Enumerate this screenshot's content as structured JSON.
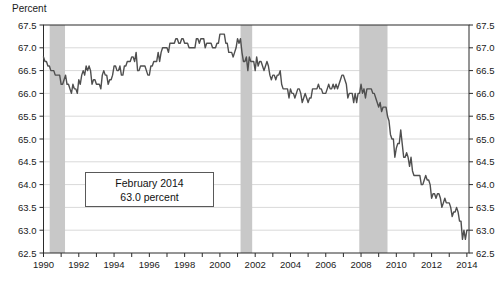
{
  "chart": {
    "y_axis_title": "Percent",
    "annotation": {
      "line1": "February 2014",
      "line2": "63.0 percent"
    },
    "colors": {
      "line": "#4f4f4f",
      "grid": "#d9d9d9",
      "band": "#c8c8c8",
      "axis": "#2b2b2b",
      "text": "#1a1a1a",
      "annotation_border": "#595959",
      "background": "#ffffff"
    }
  },
  "chart_data": {
    "type": "line",
    "title": "",
    "xlabel": "",
    "ylabel": "Percent",
    "xlim": [
      1990,
      2014.12
    ],
    "ylim": [
      62.5,
      67.5
    ],
    "grid": "horizontal",
    "legend": "none",
    "x_tick_labels": [
      "1990",
      "1992",
      "1994",
      "1996",
      "1998",
      "2000",
      "2002",
      "2004",
      "2006",
      "2008",
      "2010",
      "2012",
      "2014"
    ],
    "x_minor_tick_interval_years": 1,
    "y_tick_labels": [
      "62.5",
      "63.0",
      "63.5",
      "64.0",
      "64.5",
      "65.0",
      "65.5",
      "66.0",
      "66.5",
      "67.0",
      "67.5"
    ],
    "y_tick_step": 0.5,
    "recession_bands": [
      [
        1990.35,
        1991.22
      ],
      [
        2001.17,
        2001.83
      ],
      [
        2007.9,
        2009.5
      ]
    ],
    "annotation": {
      "line1": "February 2014",
      "line2": "63.0 percent"
    },
    "series": [
      {
        "name": "percent",
        "x_start": 1990.0,
        "x_step_years": 0.0833333,
        "values": [
          66.8,
          66.7,
          66.7,
          66.6,
          66.6,
          66.5,
          66.5,
          66.5,
          66.4,
          66.4,
          66.4,
          66.4,
          66.2,
          66.2,
          66.3,
          66.4,
          66.2,
          66.2,
          66.1,
          66.0,
          66.2,
          66.1,
          66.1,
          66.0,
          66.3,
          66.2,
          66.4,
          66.5,
          66.4,
          66.6,
          66.5,
          66.6,
          66.5,
          66.2,
          66.3,
          66.3,
          66.2,
          66.2,
          66.2,
          66.1,
          66.4,
          66.5,
          66.4,
          66.4,
          66.2,
          66.3,
          66.3,
          66.4,
          66.6,
          66.6,
          66.5,
          66.5,
          66.6,
          66.4,
          66.4,
          66.6,
          66.6,
          66.7,
          66.7,
          66.7,
          66.8,
          66.8,
          66.7,
          66.9,
          66.5,
          66.5,
          66.6,
          66.6,
          66.6,
          66.6,
          66.5,
          66.4,
          66.4,
          66.6,
          66.6,
          66.7,
          66.7,
          66.7,
          66.9,
          66.7,
          66.9,
          67.0,
          67.0,
          67.0,
          67.0,
          66.9,
          67.1,
          67.1,
          67.1,
          67.1,
          67.2,
          67.2,
          67.1,
          67.1,
          67.2,
          67.2,
          67.1,
          67.1,
          67.1,
          67.0,
          67.0,
          67.0,
          67.0,
          67.0,
          67.2,
          67.2,
          67.1,
          67.2,
          67.2,
          67.2,
          67.0,
          67.1,
          67.1,
          67.1,
          67.1,
          67.0,
          67.0,
          67.0,
          67.1,
          67.1,
          67.3,
          67.3,
          67.3,
          67.3,
          67.1,
          67.1,
          66.9,
          66.9,
          66.9,
          66.8,
          66.9,
          67.0,
          67.2,
          67.1,
          67.2,
          66.9,
          66.7,
          66.7,
          66.8,
          66.5,
          66.8,
          66.7,
          66.7,
          66.7,
          66.5,
          66.8,
          66.6,
          66.7,
          66.7,
          66.6,
          66.5,
          66.6,
          66.7,
          66.6,
          66.4,
          66.3,
          66.4,
          66.4,
          66.3,
          66.4,
          66.4,
          66.5,
          66.2,
          66.1,
          66.1,
          66.1,
          66.1,
          65.9,
          66.1,
          66.0,
          66.0,
          65.9,
          66.0,
          66.1,
          66.1,
          66.0,
          65.8,
          65.9,
          66.0,
          65.9,
          65.8,
          65.9,
          65.9,
          66.1,
          66.1,
          66.1,
          66.1,
          66.2,
          66.1,
          66.1,
          66.0,
          66.0,
          66.0,
          66.1,
          66.2,
          66.1,
          66.1,
          66.2,
          66.1,
          66.2,
          66.1,
          66.2,
          66.3,
          66.4,
          66.4,
          66.3,
          66.2,
          65.9,
          66.0,
          66.0,
          66.0,
          65.8,
          66.0,
          65.8,
          66.0,
          66.0,
          66.2,
          66.0,
          66.1,
          65.9,
          66.1,
          66.1,
          66.1,
          66.1,
          66.0,
          66.0,
          65.9,
          65.8,
          65.7,
          65.8,
          65.6,
          65.7,
          65.7,
          65.7,
          65.5,
          65.4,
          65.1,
          65.0,
          65.0,
          64.6,
          64.8,
          64.9,
          64.9,
          65.2,
          64.9,
          64.6,
          64.6,
          64.7,
          64.6,
          64.4,
          64.6,
          64.3,
          64.2,
          64.2,
          64.2,
          64.2,
          64.2,
          64.0,
          64.0,
          64.1,
          64.2,
          64.1,
          64.1,
          64.0,
          63.7,
          63.8,
          63.8,
          63.7,
          63.8,
          63.8,
          63.7,
          63.5,
          63.6,
          63.7,
          63.6,
          63.6,
          63.6,
          63.5,
          63.3,
          63.4,
          63.4,
          63.5,
          63.4,
          63.2,
          63.2,
          62.8,
          63.0,
          62.8,
          63.0,
          63.0
        ]
      }
    ]
  }
}
